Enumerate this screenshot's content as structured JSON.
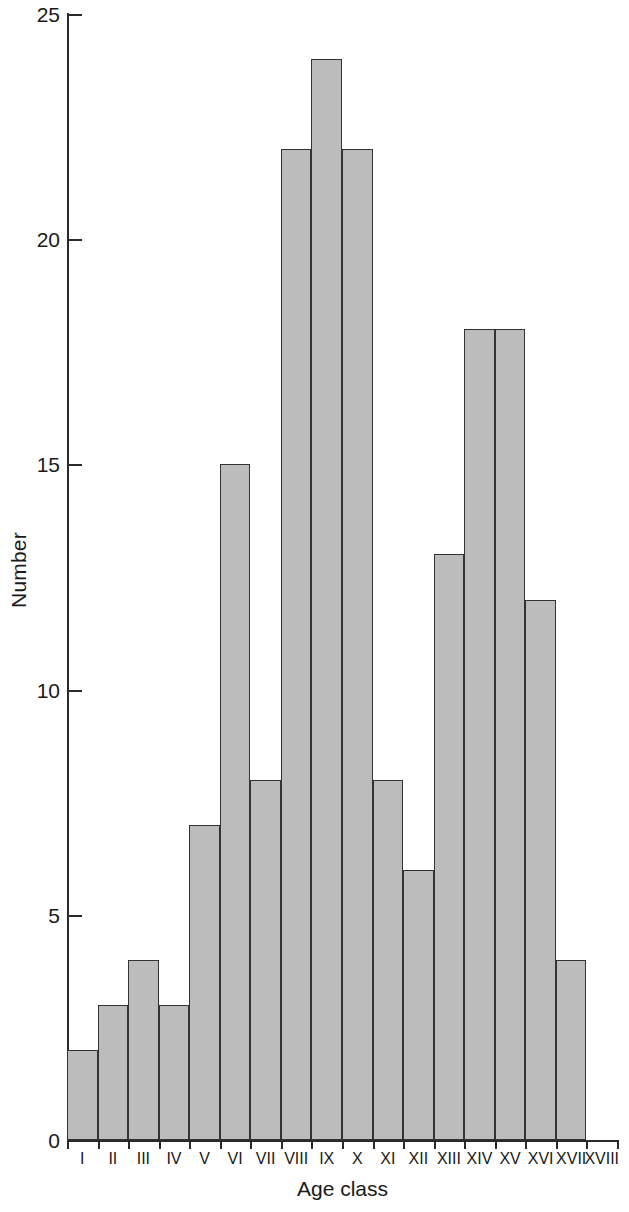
{
  "chart_data": {
    "type": "bar",
    "title": "",
    "subtitle": "",
    "xlabel": "Age class",
    "ylabel": "Number",
    "categories": [
      "I",
      "II",
      "III",
      "IV",
      "V",
      "VI",
      "VII",
      "VIII",
      "IX",
      "X",
      "XI",
      "XII",
      "XIII",
      "XIV",
      "XV",
      "XVI",
      "XVII",
      "XVIII"
    ],
    "values": [
      2,
      3,
      4,
      3,
      7,
      15,
      8,
      22,
      24,
      22,
      8,
      6,
      13,
      18,
      18,
      12,
      4,
      0
    ],
    "ylim": [
      0,
      25
    ],
    "ytick_values": [
      0,
      5,
      10,
      15,
      20,
      25
    ],
    "ytick_labels": [
      "0",
      "5",
      "10",
      "15",
      "20",
      "25"
    ],
    "grid": false,
    "legend": null,
    "legend_position": "none",
    "bar_fill_color": "#bcbcbc",
    "bar_edge_color": "#333333",
    "axis_color": "#2a2a2a",
    "background_color": "#ffffff",
    "annotations": []
  }
}
